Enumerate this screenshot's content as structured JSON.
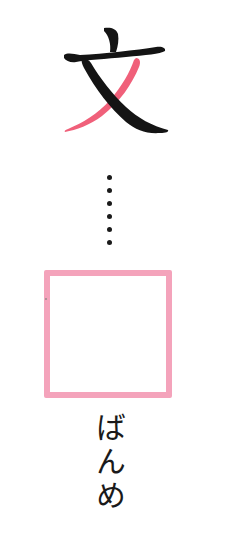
{
  "kanji": {
    "character": "文",
    "highlighted_stroke_color": "#f0607a",
    "stroke_color": "#141414"
  },
  "dots": {
    "count": 6
  },
  "answer_box": {
    "value": "",
    "border_color": "#f4a3bb"
  },
  "reading": {
    "text": "ばんめ"
  }
}
